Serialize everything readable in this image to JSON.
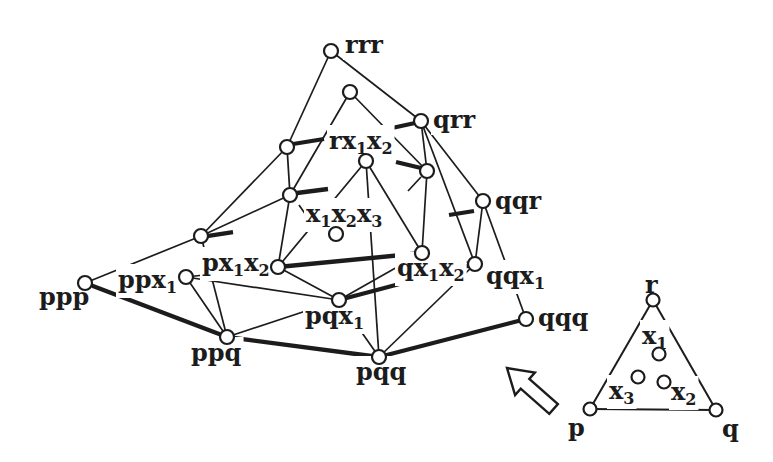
{
  "figure": {
    "style": {
      "ink_color": "#1c1c1c",
      "paper_color": "#ffffff"
    },
    "main_diagram": {
      "nodes": [
        {
          "id": "rrr",
          "x": 331,
          "y": 51,
          "label": "rrr",
          "lx": 345,
          "ly": 53
        },
        {
          "id": "rrx",
          "x": 350,
          "y": 92,
          "label": "",
          "lx": 0,
          "ly": 0
        },
        {
          "id": "qrr",
          "x": 421,
          "y": 121,
          "label": "qrr",
          "lx": 433,
          "ly": 128
        },
        {
          "id": "prr",
          "x": 287,
          "y": 147,
          "label": "",
          "lx": 0,
          "ly": 0
        },
        {
          "id": "rxx",
          "x": 366,
          "y": 161,
          "label": "rx_1x_2",
          "lx": 329,
          "ly": 149
        },
        {
          "id": "qrx",
          "x": 427,
          "y": 171,
          "label": "",
          "lx": 0,
          "ly": 0
        },
        {
          "id": "prx",
          "x": 290,
          "y": 195,
          "label": "",
          "lx": 0,
          "ly": 0
        },
        {
          "id": "qqr",
          "x": 483,
          "y": 201,
          "label": "qqr",
          "lx": 495,
          "ly": 209
        },
        {
          "id": "xxx",
          "x": 336,
          "y": 234,
          "label": "x_1x_2x_3",
          "lx": 306,
          "ly": 222
        },
        {
          "id": "ppr",
          "x": 201,
          "y": 236,
          "label": "",
          "lx": 0,
          "ly": 0
        },
        {
          "id": "qxx",
          "x": 422,
          "y": 253,
          "label": "qx_1x_2",
          "lx": 397,
          "ly": 276
        },
        {
          "id": "qqx",
          "x": 475,
          "y": 264,
          "label": "qqx_1",
          "lx": 486,
          "ly": 284
        },
        {
          "id": "pxx",
          "x": 278,
          "y": 267,
          "label": "px_1x_2",
          "lx": 202,
          "ly": 271
        },
        {
          "id": "ppx",
          "x": 186,
          "y": 277,
          "label": "ppx_1",
          "lx": 118,
          "ly": 288
        },
        {
          "id": "ppp",
          "x": 85,
          "y": 283,
          "label": "ppp",
          "lx": 39,
          "ly": 305
        },
        {
          "id": "pqx",
          "x": 339,
          "y": 300,
          "label": "pqx_1",
          "lx": 305,
          "ly": 324
        },
        {
          "id": "qqq",
          "x": 526,
          "y": 319,
          "label": "qqq",
          "lx": 538,
          "ly": 326
        },
        {
          "id": "ppq",
          "x": 227,
          "y": 337,
          "label": "ppq",
          "lx": 191,
          "ly": 361
        },
        {
          "id": "pqq",
          "x": 379,
          "y": 357,
          "label": "pqq",
          "lx": 356,
          "ly": 380
        }
      ],
      "edges": [
        {
          "from": "rrr",
          "to": "qrr",
          "weight": "thin"
        },
        {
          "from": "qrr",
          "to": "qqr",
          "weight": "thin"
        },
        {
          "from": "qqr",
          "to": "qqq",
          "weight": "thin"
        },
        {
          "from": "rrr",
          "to": "prr",
          "weight": "thin"
        },
        {
          "from": "prr",
          "to": "ppr",
          "weight": "thin"
        },
        {
          "from": "ppr",
          "to": "ppp",
          "weight": "thin"
        },
        {
          "from": "prr",
          "to": "prx",
          "weight": "thin"
        },
        {
          "from": "ppr",
          "to": "prx",
          "weight": "thin"
        },
        {
          "from": "ppr",
          "to": "ppq",
          "weight": "thin"
        },
        {
          "from": "rrx",
          "to": "prx",
          "weight": "thin"
        },
        {
          "from": "rrx",
          "to": "qrx",
          "weight": "thin"
        },
        {
          "from": "qrr",
          "to": "qrx",
          "weight": "thin"
        },
        {
          "from": "qrr",
          "to": "qqx",
          "weight": "thin"
        },
        {
          "from": "qqr",
          "to": "qqx",
          "weight": "thin"
        },
        {
          "from": "ppq",
          "to": "ppx",
          "weight": "thin"
        },
        {
          "from": "ppq",
          "to": "pqx",
          "weight": "thin"
        },
        {
          "from": "pqq",
          "to": "pqx",
          "weight": "thin"
        },
        {
          "from": "pqq",
          "to": "rxx",
          "weight": "thin"
        },
        {
          "from": "pqq",
          "to": "qqx",
          "weight": "thin"
        },
        {
          "from": "pqx",
          "to": "pxx",
          "weight": "thin"
        },
        {
          "from": "pqx",
          "to": "qxx",
          "weight": "thin"
        },
        {
          "from": "ppx",
          "to": "pxx",
          "weight": "thin"
        },
        {
          "from": "ppx",
          "to": "pqx",
          "weight": "thin"
        },
        {
          "from": "qqx",
          "to": "qxx",
          "weight": "thin"
        },
        {
          "from": "rxx",
          "to": "pxx",
          "weight": "thin"
        },
        {
          "from": "rxx",
          "to": "qxx",
          "weight": "thin"
        },
        {
          "from": "prx",
          "to": "pxx",
          "weight": "thin"
        },
        {
          "from": "qrx",
          "to": "qxx",
          "weight": "thin"
        },
        {
          "from": "ppp",
          "to": "ppq",
          "weight": "thick"
        },
        {
          "from": "ppq",
          "to": "pqq",
          "weight": "thick"
        },
        {
          "from": "pqq",
          "to": "qqq",
          "weight": "thick"
        },
        {
          "from": "pxx",
          "to": "qxx",
          "weight": "thick"
        },
        {
          "from": "pqx",
          "to": "qqx",
          "weight": "thick"
        }
      ],
      "broken_edge_stubs_thick": [
        [
          293,
          144,
          324,
          139
        ],
        [
          392,
          128,
          415,
          123
        ],
        [
          207,
          236,
          233,
          232
        ],
        [
          449,
          215,
          474,
          211
        ],
        [
          297,
          193,
          328,
          189
        ],
        [
          396,
          162,
          421,
          168
        ]
      ],
      "broken_edge_stubs_thin": [
        [
          421,
          177,
          408,
          191
        ],
        [
          299,
          205,
          308,
          218
        ]
      ]
    },
    "key_triangle": {
      "nodes": [
        {
          "id": "r",
          "x": 653,
          "y": 300,
          "label": "r",
          "lx": 645,
          "ly": 293
        },
        {
          "id": "p",
          "x": 590,
          "y": 409,
          "label": "p",
          "lx": 568,
          "ly": 436
        },
        {
          "id": "q",
          "x": 716,
          "y": 410,
          "label": "q",
          "lx": 722,
          "ly": 437
        },
        {
          "id": "x1",
          "x": 659,
          "y": 354,
          "label": "x_1",
          "lx": 642,
          "ly": 344
        },
        {
          "id": "x2",
          "x": 664,
          "y": 382,
          "label": "x_2",
          "lx": 671,
          "ly": 400
        },
        {
          "id": "x3",
          "x": 638,
          "y": 377,
          "label": "x_3",
          "lx": 609,
          "ly": 399
        }
      ],
      "edges": [
        {
          "from": "p",
          "to": "q",
          "weight": "key"
        },
        {
          "from": "q",
          "to": "r",
          "weight": "key"
        },
        {
          "from": "r",
          "to": "p",
          "weight": "key"
        }
      ],
      "broken_edge_stubs_thick": [],
      "broken_edge_stubs_thin": []
    },
    "arrow": {
      "direction": "up-left",
      "points": "507,368 534.9,372.5 529.3,378.9 557.9,404 549.3,413.8 520.7,388.7 515.1,395.1"
    }
  }
}
